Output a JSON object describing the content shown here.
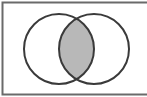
{
  "diagram": {
    "type": "venn",
    "sets": 2,
    "shaded_region": "intersection",
    "colors": {
      "background": "#ffffff",
      "stroke": "#3a3a3a",
      "frame": "#6a6a6a",
      "shade": "#b8b8b8"
    }
  }
}
